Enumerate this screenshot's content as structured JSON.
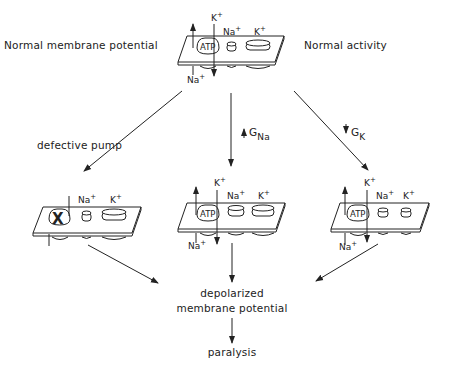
{
  "title_left": "Normal membrane potential",
  "title_right": "Normal activity",
  "branches": {
    "left": {
      "label": "defective pump"
    },
    "center": {
      "label_prefix": "G",
      "label_sub": "Na",
      "direction": "increase"
    },
    "right": {
      "label_prefix": "G",
      "label_sub": "K",
      "direction": "decrease"
    }
  },
  "ions": {
    "k": "K",
    "na": "Na",
    "plus": "+",
    "atp": "ATP",
    "blocked": "X"
  },
  "membranes": [
    {
      "id": "normal",
      "pump": "ATP",
      "na_channel": "small",
      "k_channel": "large"
    },
    {
      "id": "defective-pump",
      "pump": "X",
      "na_channel": "small",
      "k_channel": "large"
    },
    {
      "id": "increased-gna",
      "pump": "ATP",
      "na_channel": "medium",
      "k_channel": "large"
    },
    {
      "id": "decreased-gk",
      "pump": "ATP",
      "na_channel": "small",
      "k_channel": "small"
    }
  ],
  "outcome": {
    "line1": "depolarized",
    "line2": "membrane potential",
    "final": "paralysis"
  }
}
